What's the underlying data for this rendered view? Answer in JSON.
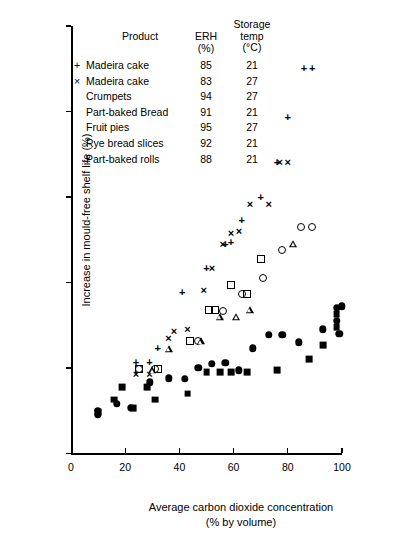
{
  "chart_data": {
    "type": "scatter",
    "title": "",
    "xlabel": "Average carbon dioxide concentration\n(% by volume)",
    "xlabel_line1": "Average carbon dioxide concentration",
    "xlabel_line2": "(% by volume)",
    "ylabel": "Increase in mould-free shelf life (%)",
    "xlim": [
      0,
      100
    ],
    "ylim": [
      0,
      500
    ],
    "xticks": [
      0,
      20,
      40,
      60,
      80,
      100
    ],
    "yticks": [
      0,
      100,
      200,
      300,
      400,
      500
    ],
    "grid": false,
    "legend_position": "top-center",
    "legend_headers": {
      "product": "Product",
      "erh": "ERH",
      "erh_unit": "(%)",
      "temp_line1": "Storage",
      "temp_line2": "temp",
      "temp_unit": "(°C)"
    },
    "series": [
      {
        "name": "Madeira cake",
        "marker": "plus",
        "erh": "85",
        "temp": "21",
        "points": [
          [
            24,
            112
          ],
          [
            29,
            112
          ],
          [
            32,
            128
          ],
          [
            41,
            193
          ],
          [
            50,
            222
          ],
          [
            57,
            250
          ],
          [
            59,
            252
          ],
          [
            63,
            278
          ],
          [
            70,
            305
          ],
          [
            76,
            345
          ],
          [
            80,
            398
          ],
          [
            86,
            455
          ],
          [
            89,
            455
          ]
        ]
      },
      {
        "name": "Madeira cake",
        "marker": "cross",
        "erh": "83",
        "temp": "27",
        "points": [
          [
            24,
            97
          ],
          [
            29,
            97
          ],
          [
            36,
            140
          ],
          [
            38,
            148
          ],
          [
            43,
            150
          ],
          [
            49,
            196
          ],
          [
            52,
            221
          ],
          [
            56,
            250
          ],
          [
            59,
            262
          ],
          [
            62,
            265
          ],
          [
            66,
            296
          ],
          [
            73,
            296
          ],
          [
            77,
            345
          ],
          [
            80,
            345
          ]
        ]
      },
      {
        "name": "Crumpets",
        "marker": "ocirc",
        "erh": "94",
        "temp": "27",
        "points": [
          [
            25,
            99
          ],
          [
            31,
            99
          ],
          [
            47,
            131
          ],
          [
            56,
            167
          ],
          [
            63,
            187
          ],
          [
            71,
            205
          ],
          [
            78,
            238
          ],
          [
            85,
            265
          ],
          [
            89,
            265
          ]
        ]
      },
      {
        "name": "Part-baked Bread",
        "marker": "osq",
        "erh": "91",
        "temp": "21",
        "points": [
          [
            25,
            99
          ],
          [
            32,
            99
          ],
          [
            44,
            131
          ],
          [
            51,
            168
          ],
          [
            53,
            168
          ],
          [
            59,
            197
          ],
          [
            65,
            186
          ],
          [
            70,
            227
          ]
        ]
      },
      {
        "name": "Fruit pies",
        "marker": "otri",
        "erh": "95",
        "temp": "27",
        "points": [
          [
            30,
            97
          ],
          [
            36,
            122
          ],
          [
            48,
            131
          ],
          [
            55,
            160
          ],
          [
            61,
            160
          ],
          [
            66,
            168
          ],
          [
            82,
            245
          ]
        ]
      },
      {
        "name": "Rye bread slices",
        "marker": "fcirc",
        "erh": "92",
        "temp": "21",
        "points": [
          [
            10,
            45
          ],
          [
            10,
            50
          ],
          [
            17,
            58
          ],
          [
            22,
            53
          ],
          [
            29,
            83
          ],
          [
            36,
            88
          ],
          [
            42,
            87
          ],
          [
            47,
            100
          ],
          [
            52,
            105
          ],
          [
            57,
            106
          ],
          [
            62,
            97
          ],
          [
            67,
            123
          ],
          [
            73,
            139
          ],
          [
            78,
            139
          ],
          [
            84,
            130
          ],
          [
            93,
            145
          ],
          [
            98,
            155
          ],
          [
            98,
            170
          ],
          [
            99,
            140
          ],
          [
            100,
            172
          ]
        ]
      },
      {
        "name": "Part-baked rolls",
        "marker": "fsq",
        "erh": "88",
        "temp": "21",
        "points": [
          [
            10,
            48
          ],
          [
            16,
            63
          ],
          [
            19,
            78
          ],
          [
            23,
            53
          ],
          [
            28,
            78
          ],
          [
            31,
            63
          ],
          [
            43,
            70
          ],
          [
            50,
            95
          ],
          [
            55,
            95
          ],
          [
            59,
            95
          ],
          [
            65,
            95
          ],
          [
            76,
            97
          ],
          [
            88,
            110
          ],
          [
            93,
            127
          ],
          [
            98,
            148
          ],
          [
            98,
            163
          ]
        ]
      }
    ]
  }
}
